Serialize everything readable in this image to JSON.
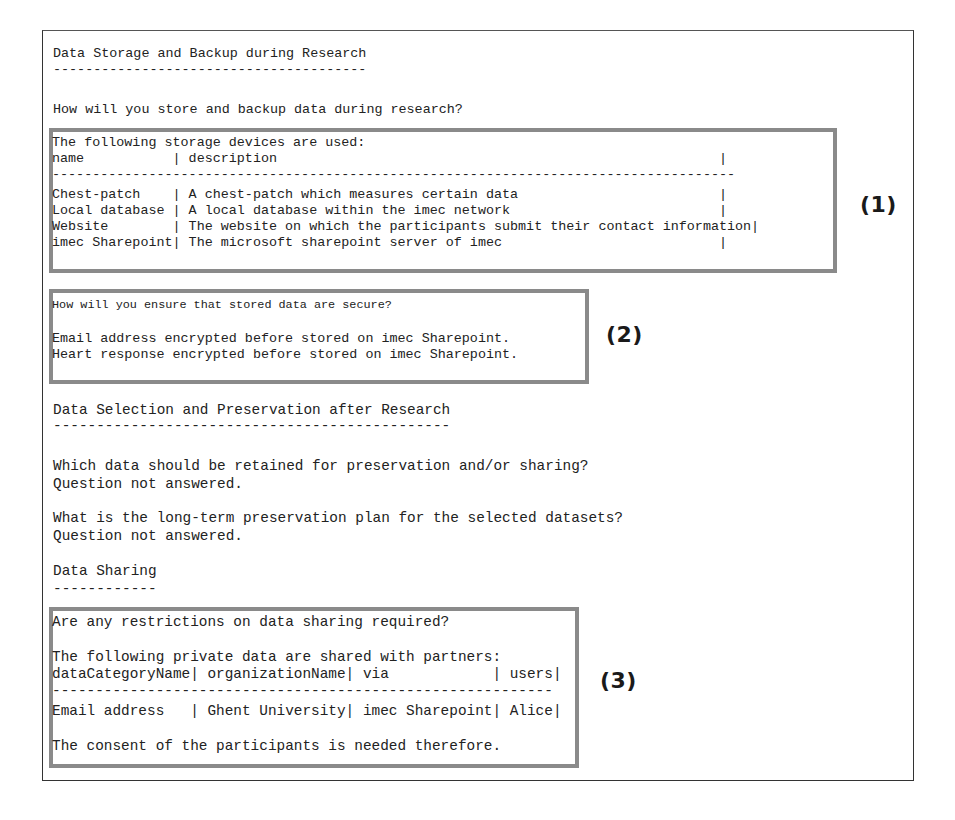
{
  "document": {
    "sections": [
      {
        "title": "Data Storage and Backup during Research",
        "underline": "---------------------------------------",
        "question_storage": "How will you store and backup data during research?",
        "storage_devices": {
          "intro": "The following storage devices are used:",
          "header": "name           | description                                                       |",
          "separator": "-------------------------------------------------------------------------------------",
          "columns": [
            "name",
            "description"
          ],
          "rows_text": [
            "Chest-patch    | A chest-patch which measures certain data                         |",
            "Local database | A local database within the imec network                          |",
            "Website        | The website on which the participants submit their contact information|",
            "imec Sharepoint| The microsoft sharepoint server of imec                           |"
          ],
          "rows": [
            {
              "name": "Chest-patch",
              "description": "A chest-patch which measures certain data"
            },
            {
              "name": "Local database",
              "description": "A local database within the imec network"
            },
            {
              "name": "Website",
              "description": "The website on which the participants submit their contact information"
            },
            {
              "name": "imec Sharepoint",
              "description": "The microsoft sharepoint server of imec"
            }
          ]
        },
        "security": {
          "question": "How will you ensure that stored data are secure?",
          "answers": [
            "Email address encrypted before stored on imec Sharepoint.",
            "Heart response encrypted before stored on imec Sharepoint."
          ]
        }
      },
      {
        "title": "Data Selection and Preservation after Research",
        "underline": "----------------------------------------------",
        "qa": [
          {
            "question": "Which data should be retained for preservation and/or sharing?",
            "answer": "Question not answered."
          },
          {
            "question": "What is the long-term preservation plan for the selected datasets?",
            "answer": "Question not answered."
          }
        ]
      },
      {
        "title": "Data Sharing",
        "underline": "------------",
        "restrictions": {
          "question": "Are any restrictions on data sharing required?",
          "intro": "The following private data are shared with partners:",
          "header": "dataCategoryName| organizationName| via            | users|",
          "separator": "----------------------------------------------------------",
          "columns": [
            "dataCategoryName",
            "organizationName",
            "via",
            "users"
          ],
          "row_text": "Email address   | Ghent University| imec Sharepoint| Alice|",
          "rows": [
            {
              "dataCategoryName": "Email address",
              "organizationName": "Ghent University",
              "via": "imec Sharepoint",
              "users": "Alice"
            }
          ],
          "note": "The consent of the participants is needed therefore."
        }
      }
    ]
  },
  "annotations": {
    "label_1": "(1)",
    "label_2": "(2)",
    "label_3": "(3)"
  },
  "colors": {
    "highlight_border": "#8a8a8a",
    "frame_border": "#333333",
    "text": "#222222"
  }
}
